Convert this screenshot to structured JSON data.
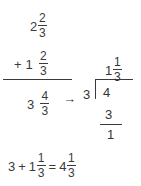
{
  "document": {
    "kind": "math-worksheet",
    "topic": "Adding mixed numbers and renaming an improper fraction",
    "ink_color": "#3a3a3a",
    "background_color": "#ffffff"
  },
  "addition": {
    "addend_one": {
      "whole": "2",
      "numerator": "2",
      "denominator": "3"
    },
    "addend_two": {
      "sign": "+",
      "whole": "1",
      "numerator": "2",
      "denominator": "3"
    },
    "sum": {
      "whole": "3",
      "numerator": "4",
      "denominator": "3"
    }
  },
  "arrow": {
    "glyph": "→"
  },
  "long_division": {
    "quotient": {
      "whole": "1",
      "numerator": "1",
      "denominator": "3"
    },
    "divisor": "3",
    "dividend": "4",
    "subtrahend": "3",
    "remainder": "1"
  },
  "final_equation": {
    "first_term": "3",
    "plus": "+",
    "second_term": {
      "whole": "1",
      "numerator": "1",
      "denominator": "3"
    },
    "equals": "=",
    "result": {
      "whole": "4",
      "numerator": "1",
      "denominator": "3"
    }
  }
}
